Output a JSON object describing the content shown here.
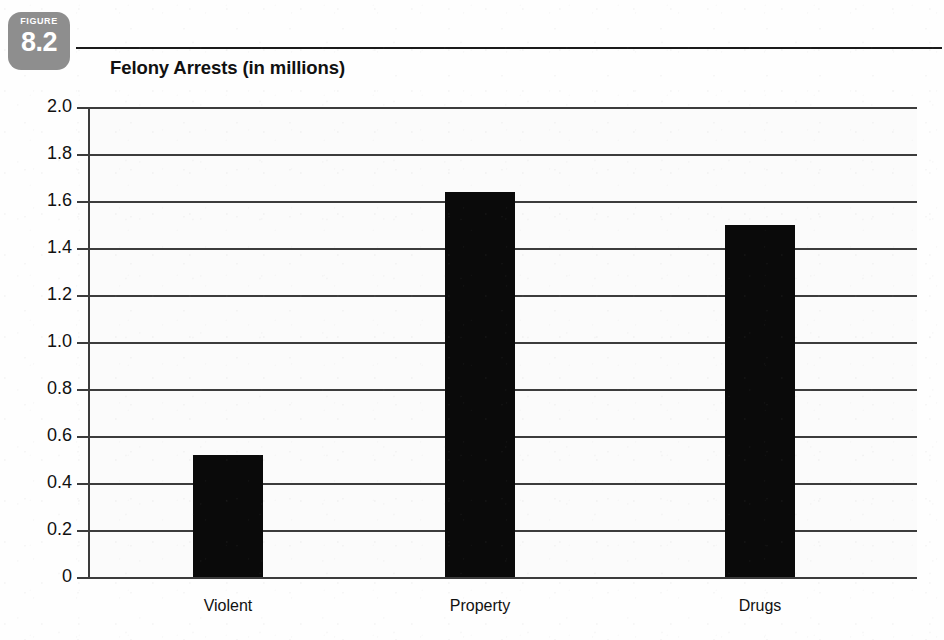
{
  "figure": {
    "kicker": "FIGURE",
    "number": "8.2",
    "badge_color": "#8e8e8e"
  },
  "chart_data": {
    "type": "bar",
    "title": "Felony Arrests (in millions)",
    "categories": [
      "Violent",
      "Property",
      "Drugs"
    ],
    "values": [
      0.52,
      1.64,
      1.5
    ],
    "series": [
      {
        "name": "Felony Arrests",
        "values": [
          0.52,
          1.64,
          1.5
        ]
      }
    ],
    "xlabel": "",
    "ylabel": "",
    "ylim": [
      0,
      2.0
    ],
    "ytick_labels": [
      "2.0",
      "1.8",
      "1.6",
      "1.4",
      "1.2",
      "1.0",
      "0.8",
      "0.6",
      "0.4",
      "0.2",
      "0"
    ],
    "ytick_values": [
      2.0,
      1.8,
      1.6,
      1.4,
      1.2,
      1.0,
      0.8,
      0.6,
      0.4,
      0.2,
      0
    ],
    "grid": true,
    "legend": false,
    "legend_position": "none",
    "bar_color": "#0a0a0a",
    "gridline_color": "#3c3c3c",
    "plot_background": "#fbfbfb"
  }
}
